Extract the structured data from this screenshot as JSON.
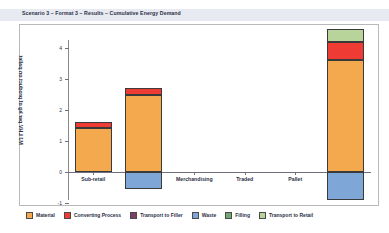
{
  "header": {
    "title": "Scenario 3 – Format 3 – Results – Cumulative Energy Demand"
  },
  "chart_data": {
    "type": "bar",
    "stacked": true,
    "title": "Scenario 3 – Format 3 – Results – Cumulative Energy Demand",
    "xlabel": "",
    "ylabel": "MJ LHV per kg of product on pallet",
    "ylim": [
      -1,
      4.6
    ],
    "yticks": [
      4,
      3,
      2,
      1,
      0,
      -1
    ],
    "ytick_labels": [
      "4",
      "3",
      "2",
      "1",
      "0",
      "-1"
    ],
    "grid": false,
    "legend_position": "bottom",
    "categories": [
      "Sub-retail",
      "Retail",
      "Merchandising",
      "Traded",
      "Pallet",
      "Total"
    ],
    "series": [
      {
        "name": "Material",
        "color": "#F5A94E",
        "values": [
          1.42,
          2.48,
          0,
          0,
          0,
          3.6
        ]
      },
      {
        "name": "Converting Process",
        "color": "#EE3B33",
        "values": [
          0.18,
          0.22,
          0,
          0,
          0,
          0.6
        ]
      },
      {
        "name": "Transport to Filler",
        "color": "#7B3F66",
        "values": [
          0,
          0,
          0,
          0,
          0,
          0
        ]
      },
      {
        "name": "Waste",
        "color": "#7EA6D6",
        "values": [
          0,
          -0.55,
          0,
          0,
          0,
          -0.9
        ]
      },
      {
        "name": "Filling",
        "color": "#6FA96F",
        "values": [
          0,
          0,
          0,
          0,
          0,
          0
        ]
      },
      {
        "name": "Transport to Retail",
        "color": "#B9D49B",
        "values": [
          0,
          0,
          0,
          0,
          0,
          0.4
        ]
      }
    ],
    "totals": [
      1.6,
      2.7,
      0,
      0,
      0,
      4.6
    ]
  },
  "legend": {
    "items": [
      {
        "label": "Material",
        "color": "#F5A94E"
      },
      {
        "label": "Converting Process",
        "color": "#EE3B33"
      },
      {
        "label": "Transport to Filler",
        "color": "#7B3F66"
      },
      {
        "label": "Waste",
        "color": "#7EA6D6"
      },
      {
        "label": "Filling",
        "color": "#6FA96F"
      },
      {
        "label": "Transport to Retail",
        "color": "#B9D49B"
      }
    ]
  }
}
